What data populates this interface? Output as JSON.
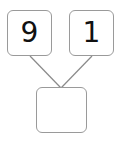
{
  "diagram": {
    "type": "number-bond",
    "top_left": {
      "value": "9"
    },
    "top_right": {
      "value": "1"
    },
    "bottom": {
      "value": ""
    },
    "colors": {
      "border": "#9a9a9a",
      "line": "#8a8a8a",
      "text": "#111111"
    }
  }
}
